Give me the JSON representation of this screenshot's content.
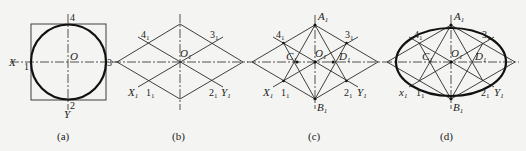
{
  "figure": {
    "panels": [
      {
        "id": "a",
        "caption": "(a)",
        "labels": {
          "top": "4",
          "left": "1",
          "right": "3",
          "bottom": "2",
          "x_axis": "X",
          "y_axis": "Y",
          "center": "O"
        }
      },
      {
        "id": "b",
        "caption": "(b)",
        "labels": {
          "p4": "4",
          "p3": "3",
          "p1": "1",
          "p2": "2",
          "center": "O",
          "x_axis": "X",
          "y_axis": "Y",
          "sub": "1"
        }
      },
      {
        "id": "c",
        "caption": "(c)",
        "labels": {
          "top": "A",
          "bottom": "B",
          "left_c": "C",
          "right_d": "D",
          "p4": "4",
          "p3": "3",
          "p1": "1",
          "p2": "2",
          "center": "O",
          "x_axis": "X",
          "y_axis": "Y",
          "sub": "1"
        }
      },
      {
        "id": "d",
        "caption": "(d)",
        "labels": {
          "top": "A",
          "bottom": "B",
          "left_c": "C",
          "right_d": "D",
          "p4": "4",
          "p3": "3",
          "p1": "1",
          "p2": "2",
          "center": "O",
          "x_axis": "x",
          "y_axis": "Y",
          "sub": "1"
        }
      }
    ]
  }
}
